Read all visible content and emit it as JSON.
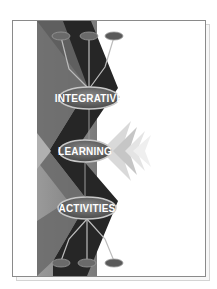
{
  "cover": {
    "title_lines": [
      {
        "label": "INTEGRATIVE"
      },
      {
        "label": "LEARNING"
      },
      {
        "label": "ACTIVITIES"
      }
    ],
    "colors": {
      "background": "#ffffff",
      "light_band": "#8c8c8c",
      "dark_band": "#262626",
      "mid_band": "#5a5a5a",
      "ellipse_fill": "#6e6e6e",
      "ellipse_ring": "#bdbdbd",
      "text": "#ffffff",
      "frame": "#8a8a8a"
    }
  }
}
